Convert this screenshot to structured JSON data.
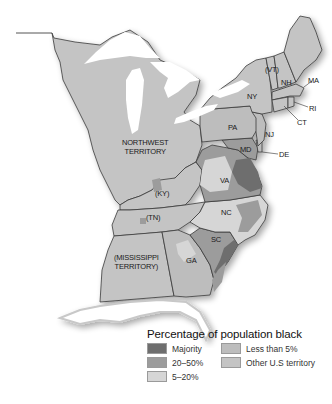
{
  "map": {
    "colors": {
      "majority": "#6e6e6e",
      "20_50": "#9c9c9c",
      "5_20": "#d6d6d6",
      "less_than_5": "#bdbdbd",
      "other_territory": "#c4c4c4",
      "water": "#ffffff",
      "border": "#3a3a3a"
    },
    "regions": [
      {
        "id": "nw",
        "label_line1": "NORTHWEST",
        "label_line2": "TERRITORY"
      },
      {
        "id": "ky",
        "label": "(KY)"
      },
      {
        "id": "tn",
        "label": "(TN)"
      },
      {
        "id": "ms",
        "label_line1": "(MISSISSIPPI",
        "label_line2": "TERRITORY)"
      },
      {
        "id": "ga",
        "label": "GA"
      },
      {
        "id": "sc",
        "label": "SC"
      },
      {
        "id": "nc",
        "label": "NC"
      },
      {
        "id": "va",
        "label": "VA"
      },
      {
        "id": "md",
        "label": "MD"
      },
      {
        "id": "de",
        "label": "DE"
      },
      {
        "id": "nj",
        "label": "NJ"
      },
      {
        "id": "pa",
        "label": "PA"
      },
      {
        "id": "ny",
        "label": "NY"
      },
      {
        "id": "vt",
        "label": "(VT)"
      },
      {
        "id": "nh",
        "label": "NH"
      },
      {
        "id": "ma",
        "label": "MA"
      },
      {
        "id": "ri",
        "label": "RI"
      },
      {
        "id": "ct",
        "label": "CT"
      }
    ]
  },
  "legend": {
    "title": "Percentage of population black",
    "items": [
      {
        "label": "Majority",
        "color": "#6e6e6e"
      },
      {
        "label": "Less than 5%",
        "color": "#bdbdbd"
      },
      {
        "label": "20–50%",
        "color": "#9c9c9c"
      },
      {
        "label": "Other U.S territory",
        "color": "#c4c4c4"
      },
      {
        "label": "5–20%",
        "color": "#d6d6d6"
      }
    ]
  }
}
